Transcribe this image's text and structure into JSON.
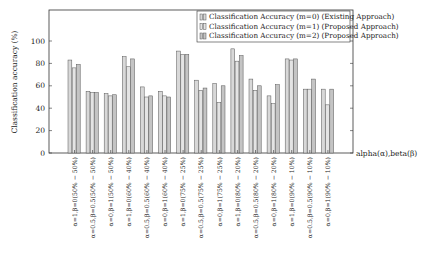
{
  "chart_data": {
    "type": "bar",
    "title": "",
    "xlabel": "alpha(α),beta(β)",
    "ylabel": "Classification accuracy (%)",
    "ylim": [
      0,
      130
    ],
    "yticks": [
      0,
      20,
      40,
      60,
      80,
      100
    ],
    "grid": false,
    "legend_position": "top-right",
    "categories": [
      "α=1,β=0(50% − 50%)",
      "α=0.5,β=0.5(50% − 50%)",
      "α=0,β=1(50% − 50%)",
      "α=1,β=0(60% − 40%)",
      "α=0.5,β=0.5(60% − 40%)",
      "α=0,β=1(60% − 40%)",
      "α=1,β=0(75% − 25%)",
      "α=0.5,β=0.5(75% − 25%)",
      "α=0,β=1(75% − 25%)",
      "α=1,β=0(80% − 20%)",
      "α=0.5,β=0.5(80% − 20%)",
      "α=0,β=1(80% − 20%)",
      "α=1,β=0(90% − 10%)",
      "α=0.5,β=0.5(90% − 10%)",
      "α=0,β=1(90% − 10%)"
    ],
    "series": [
      {
        "name": "Classification Accuracy (m=0) (Existing Approach)",
        "color": "#d8d8d8",
        "values": [
          83,
          55,
          53,
          86,
          59,
          55,
          91,
          65,
          62,
          93,
          66,
          51,
          84,
          57,
          57
        ]
      },
      {
        "name": "Classification Accuracy (m=1) (Proposed Approach)",
        "color": "#e4e4e4",
        "values": [
          76,
          54,
          51,
          77,
          50,
          51,
          88,
          56,
          45,
          82,
          56,
          44,
          83,
          57,
          43
        ]
      },
      {
        "name": "Classification Accuracy (m=2) (Proposed Approach)",
        "color": "#c4c4c4",
        "values": [
          79,
          54,
          52,
          84,
          51,
          50,
          88,
          58,
          60,
          87,
          60,
          61,
          84,
          66,
          57
        ]
      }
    ]
  }
}
